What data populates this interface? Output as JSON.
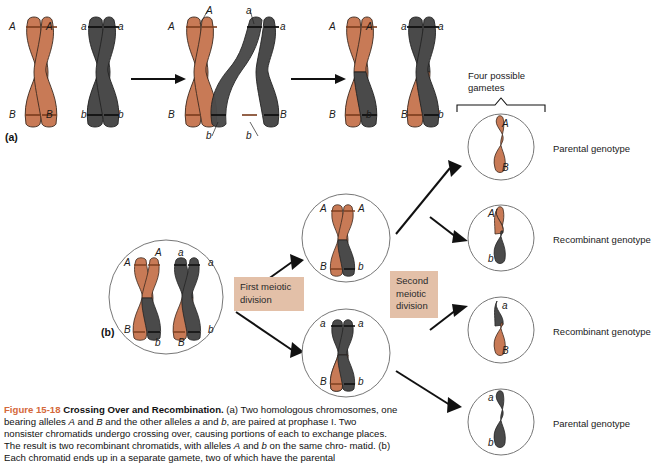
{
  "figure": {
    "number": "Figure 15-18",
    "title": "Crossing Over and Recombination.",
    "caption_part_a": "(a) Two homologous chromosomes, one bearing alleles A and B and the other alleles a and b, are paired at prophase I. Two nonsister chromatids undergo crossing over, causing portions of each to exchange places. The result is two recombinant chromatids, with alleles A and b on the same chromatid.",
    "caption_part_b": "(b) Each chromatid ends up in a separate gamete, two of which have the parental",
    "caption_lines": [
      "(a) Two homologous chromosomes, one",
      "bearing alleles A and B and the other alleles a and b, are paired at prophase I. Two",
      "nonsister chromatids undergo crossing over, causing portions of each to exchange",
      "places. The result is two recombinant chromatids, with alleles A and b on the same chro-",
      "matid. (b) Each chromatid ends up in a separate gamete, two of which have the parental"
    ]
  },
  "colors": {
    "maternal_chromosome": "#c87a56",
    "paternal_chromosome": "#4a4a4a",
    "accent_figure_number": "#d4683a",
    "stage_box_background": "#e3c0a8",
    "cell_outline": "#666666",
    "background": "#ffffff"
  },
  "panel_a": {
    "tag": "(a)",
    "steps": [
      {
        "name": "paired-homologs",
        "labels_top": [
          "A",
          "A",
          "a",
          "a"
        ],
        "labels_bottom": [
          "B",
          "B",
          "b",
          "b"
        ]
      },
      {
        "name": "crossing-over",
        "labels_top": [
          "A",
          "A",
          "a",
          "a"
        ],
        "labels_bottom": [
          "B",
          "b",
          "b",
          "B"
        ]
      },
      {
        "name": "recombinant-chromatids",
        "labels_top": [
          "A",
          "A",
          "a",
          "a"
        ],
        "labels_bottom": [
          "B",
          "b",
          "B",
          "b"
        ]
      }
    ]
  },
  "panel_b": {
    "tag": "(b)",
    "parent_cell": {
      "name": "parent-cell",
      "labels_top": [
        "A",
        "A",
        "a",
        "a"
      ],
      "labels_bottom": [
        "B",
        "b",
        "B",
        "b"
      ]
    },
    "first_division_label": "First meiotic\ndivision",
    "second_division_label": "Second\nmeiotic\ndivision",
    "daughter_cells": [
      {
        "name": "daughter-cell-upper",
        "labels_top": [
          "A",
          "A"
        ],
        "labels_bottom": [
          "B",
          "b"
        ]
      },
      {
        "name": "daughter-cell-lower",
        "labels_top": [
          "a",
          "a"
        ],
        "labels_bottom": [
          "B",
          "b"
        ]
      }
    ],
    "gametes_bracket_label": "Four possible\ngametes",
    "gametes": [
      {
        "name": "gamete-1",
        "top_allele": "A",
        "bottom_allele": "B",
        "top_color": "maternal",
        "bottom_color": "maternal",
        "genotype": "Parental genotype"
      },
      {
        "name": "gamete-2",
        "top_allele": "A",
        "bottom_allele": "b",
        "top_color": "maternal",
        "bottom_color": "paternal",
        "genotype": "Recombinant genotype"
      },
      {
        "name": "gamete-3",
        "top_allele": "a",
        "bottom_allele": "B",
        "top_color": "paternal",
        "bottom_color": "maternal",
        "genotype": "Recombinant genotype"
      },
      {
        "name": "gamete-4",
        "top_allele": "a",
        "bottom_allele": "b",
        "top_color": "paternal",
        "bottom_color": "paternal",
        "genotype": "Parental genotype"
      }
    ]
  }
}
